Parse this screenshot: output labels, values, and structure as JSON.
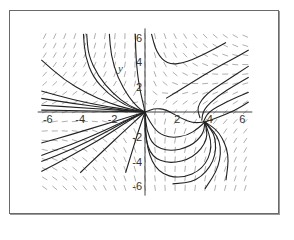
{
  "chart_data": {
    "type": "line",
    "subtype": "phase-portrait-direction-field",
    "title": "",
    "xlabel": "",
    "ylabel": "y",
    "xlim": [
      -6.5,
      6.5
    ],
    "ylim": [
      -6.5,
      6.5
    ],
    "x_ticks": [
      -6,
      -4,
      -2,
      2,
      4,
      6
    ],
    "y_ticks": [
      -6,
      -4,
      -2,
      2,
      4,
      6
    ],
    "x_tick_labels": [
      "-6",
      "-4",
      "-2",
      "2",
      "4",
      "6"
    ],
    "y_tick_labels": [
      "-6",
      "-4",
      "-2",
      "2",
      "4",
      "6"
    ],
    "grid": false,
    "legend": null,
    "equilibria": [
      {
        "x": 0,
        "y": 0,
        "type": "node"
      },
      {
        "x": 3.7,
        "y": -0.8,
        "type": "spiral"
      }
    ],
    "trajectories": [
      [
        [
          -6.4,
          4.2
        ],
        [
          -5,
          2.6
        ],
        [
          -3.6,
          1.5
        ],
        [
          -2.2,
          0.7
        ],
        [
          -1,
          0.25
        ],
        [
          0,
          0
        ]
      ],
      [
        [
          -6.4,
          1.7
        ],
        [
          -4.5,
          1
        ],
        [
          -2.6,
          0.5
        ],
        [
          -1.2,
          0.2
        ],
        [
          0,
          0
        ]
      ],
      [
        [
          -6.4,
          1.1
        ],
        [
          -4.5,
          0.7
        ],
        [
          -2.5,
          0.35
        ],
        [
          -1,
          0.1
        ],
        [
          0,
          0
        ]
      ],
      [
        [
          -6.4,
          0.55
        ],
        [
          -4,
          0.35
        ],
        [
          -2,
          0.18
        ],
        [
          0,
          0
        ]
      ],
      [
        [
          -6.4,
          0.15
        ],
        [
          -3,
          0.08
        ],
        [
          0,
          0
        ]
      ],
      [
        [
          -3.8,
          6.3
        ],
        [
          -3.7,
          4.5
        ],
        [
          -3.2,
          2.8
        ],
        [
          -2.3,
          1.5
        ],
        [
          -1.2,
          0.5
        ],
        [
          0,
          0
        ]
      ],
      [
        [
          -3.6,
          6.3
        ],
        [
          -3.5,
          4.6
        ],
        [
          -2.9,
          2.9
        ],
        [
          -2,
          1.5
        ],
        [
          -1,
          0.5
        ],
        [
          0,
          0
        ]
      ],
      [
        [
          -2.2,
          6.3
        ],
        [
          -2.1,
          4.6
        ],
        [
          -1.7,
          2.8
        ],
        [
          -1,
          1.2
        ],
        [
          -0.4,
          0.3
        ],
        [
          0,
          0
        ]
      ],
      [
        [
          -0.6,
          6.3
        ],
        [
          -0.55,
          4
        ],
        [
          -0.35,
          2
        ],
        [
          -0.1,
          0.6
        ],
        [
          0,
          0
        ]
      ],
      [
        [
          -6.4,
          -2.5
        ],
        [
          -4.5,
          -1.8
        ],
        [
          -2.5,
          -1.0
        ],
        [
          -1,
          -0.4
        ],
        [
          0,
          0
        ]
      ],
      [
        [
          -6.4,
          -3.5
        ],
        [
          -4.5,
          -2.6
        ],
        [
          -2.5,
          -1.5
        ],
        [
          -1,
          -0.55
        ],
        [
          0,
          0
        ]
      ],
      [
        [
          -6.4,
          -4.0
        ],
        [
          -4.5,
          -3.0
        ],
        [
          -2.5,
          -1.7
        ],
        [
          -1,
          -0.6
        ],
        [
          0,
          0
        ]
      ],
      [
        [
          -6.4,
          -4.8
        ],
        [
          -4.5,
          -3.5
        ],
        [
          -2.5,
          -2.0
        ],
        [
          -1,
          -0.7
        ],
        [
          0,
          0
        ]
      ],
      [
        [
          -4,
          -4.9
        ],
        [
          -2.8,
          -3.4
        ],
        [
          -1.5,
          -1.8
        ],
        [
          -0.5,
          -0.6
        ],
        [
          0,
          0
        ]
      ],
      [
        [
          -1.2,
          -4.9
        ],
        [
          -0.8,
          -3.2
        ],
        [
          -0.4,
          -1.5
        ],
        [
          0,
          0
        ]
      ],
      [
        [
          0.4,
          6.3
        ],
        [
          0.7,
          4.8
        ],
        [
          1.4,
          3.8
        ],
        [
          2.6,
          4.0
        ],
        [
          4,
          4.9
        ],
        [
          5,
          5.6
        ]
      ],
      [
        [
          1.3,
          1.1
        ],
        [
          2.8,
          2.3
        ],
        [
          4.3,
          3.5
        ],
        [
          5.6,
          4.4
        ],
        [
          6.4,
          5.0
        ]
      ],
      [
        [
          3.4,
          -0.5
        ],
        [
          3.2,
          0.4
        ],
        [
          3.8,
          1.5
        ],
        [
          5.0,
          2.5
        ],
        [
          6.4,
          3.7
        ]
      ],
      [
        [
          3.5,
          -0.7
        ],
        [
          3.6,
          0.2
        ],
        [
          4.5,
          1.3
        ],
        [
          5.6,
          2.2
        ],
        [
          6.4,
          2.8
        ]
      ],
      [
        [
          3.6,
          -0.8
        ],
        [
          3.9,
          0.0
        ],
        [
          5.0,
          0.8
        ],
        [
          6.4,
          1.6
        ]
      ],
      [
        [
          3.7,
          -0.8
        ],
        [
          4.6,
          -0.4
        ],
        [
          5.5,
          0.1
        ],
        [
          6.4,
          0.8
        ]
      ],
      [
        [
          0,
          0
        ],
        [
          0.6,
          0.3
        ],
        [
          1.3,
          0.2
        ],
        [
          2.2,
          -0.5
        ],
        [
          3.0,
          -0.9
        ],
        [
          3.7,
          -0.8
        ]
      ],
      [
        [
          0,
          0
        ],
        [
          0.3,
          -0.8
        ],
        [
          0.8,
          -1.7
        ],
        [
          1.6,
          -2.1
        ],
        [
          2.6,
          -1.9
        ],
        [
          3.3,
          -1.3
        ],
        [
          3.7,
          -0.8
        ]
      ],
      [
        [
          0,
          0
        ],
        [
          0.1,
          -1.5
        ],
        [
          0.5,
          -2.7
        ],
        [
          1.5,
          -3.2
        ],
        [
          2.8,
          -2.8
        ],
        [
          3.6,
          -1.8
        ],
        [
          3.7,
          -0.8
        ]
      ],
      [
        [
          0,
          0
        ],
        [
          0.0,
          -2.0
        ],
        [
          0.4,
          -3.6
        ],
        [
          1.5,
          -4.2
        ],
        [
          3.0,
          -3.7
        ],
        [
          3.9,
          -2.2
        ],
        [
          3.7,
          -0.8
        ]
      ],
      [
        [
          0,
          0
        ],
        [
          0.1,
          -3
        ],
        [
          0.8,
          -4.9
        ],
        [
          2.2,
          -5.4
        ],
        [
          3.6,
          -4.6
        ],
        [
          4.2,
          -2.8
        ],
        [
          3.7,
          -0.8
        ]
      ],
      [
        [
          1.7,
          -5.8
        ],
        [
          3.2,
          -5.6
        ],
        [
          4.3,
          -4.0
        ],
        [
          4.4,
          -2.0
        ],
        [
          3.7,
          -0.8
        ]
      ],
      [
        [
          3.7,
          -6.2
        ],
        [
          4.6,
          -4.4
        ],
        [
          4.7,
          -2.3
        ],
        [
          3.7,
          -0.8
        ]
      ],
      [
        [
          5.0,
          -5.5
        ],
        [
          5.2,
          -3.4
        ],
        [
          4.6,
          -1.6
        ],
        [
          3.7,
          -0.8
        ]
      ]
    ],
    "field": {
      "nx": 21,
      "ny": 17,
      "seg_len_px": 6
    }
  },
  "axes": {
    "y_title": "y"
  }
}
